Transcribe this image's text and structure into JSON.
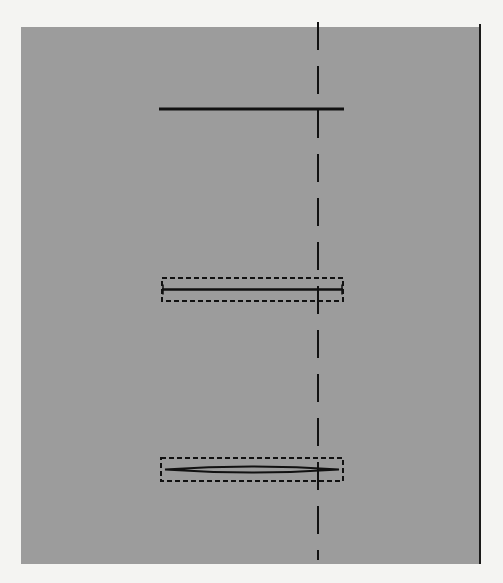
{
  "figure": {
    "background": "#f4f4f2",
    "panel": {
      "x": 21,
      "y": 27,
      "width": 459,
      "height": 537,
      "fill": "#9c9c9c",
      "right_border_color": "#1a1a1a"
    },
    "ink_color": "#111111",
    "reference_line": {
      "x": 318,
      "y1": 22,
      "y2": 560,
      "dash": "28 16",
      "stroke_width": 2
    },
    "elements": [
      {
        "id": "solid-bar",
        "type": "line",
        "x1": 159,
        "x2": 344,
        "y": 109,
        "stroke_width": 3
      },
      {
        "id": "boxed-bar",
        "type": "boxed-line",
        "box": {
          "x": 162,
          "y": 278,
          "width": 181,
          "height": 23
        },
        "line_y": 289.5,
        "line_width": 2.5
      },
      {
        "id": "boxed-lens",
        "type": "boxed-lens",
        "box": {
          "x": 161,
          "y": 458,
          "width": 182,
          "height": 23
        },
        "line_y": 469.5,
        "lens_thickness": 3
      }
    ]
  }
}
